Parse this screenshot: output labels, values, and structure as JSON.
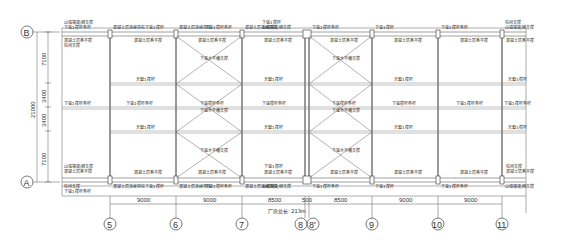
{
  "drawing": {
    "grid_rows": [
      {
        "id": "B",
        "label": "B"
      },
      {
        "id": "A",
        "label": "A"
      }
    ],
    "grid_columns": [
      {
        "id": "5",
        "label": "5"
      },
      {
        "id": "6",
        "label": "6"
      },
      {
        "id": "7",
        "label": "7"
      },
      {
        "id": "8",
        "label": "8"
      },
      {
        "id": "8p",
        "label": "8'"
      },
      {
        "id": "9",
        "label": "9"
      },
      {
        "id": "10",
        "label": "10"
      },
      {
        "id": "11",
        "label": "11"
      }
    ],
    "vertical_dims": {
      "total": "21000",
      "upper": "7100",
      "mid_upper": "3400",
      "mid_lower": "3400",
      "lower": "7100"
    },
    "horizontal_dims": [
      "9000",
      "9000",
      "8500",
      "500",
      "8500",
      "9000",
      "9000"
    ],
    "total_length_note": "厂房总长: 213m",
    "labels": {
      "col_purlin": "混凝土层连续带柱",
      "top_chord_tie": "下弦1撑杆",
      "top_chord_tie_bar": "下弦1撑杆条杆",
      "roof_brace_upper": "混凝土层系平撑",
      "side_tie": "柱间支撑",
      "gable_brace": "山墙端梁/钢支撑",
      "mid_tie": "下弦撑杆条杆",
      "horiz_brace": "下弦水平横支撑",
      "ridge_tie": "天窗1撑杆",
      "edge_note": "端部轴/连杆"
    }
  }
}
